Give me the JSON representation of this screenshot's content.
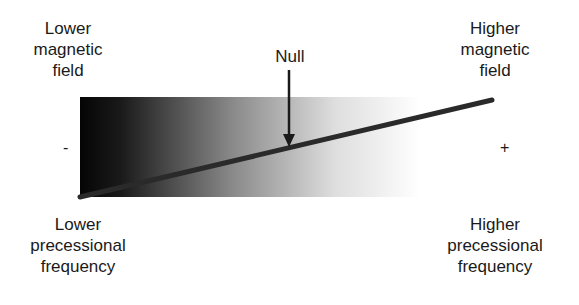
{
  "labels": {
    "top_left": [
      "Lower",
      "magnetic",
      "field"
    ],
    "top_right": [
      "Higher",
      "magnetic",
      "field"
    ],
    "bottom_left": [
      "Lower",
      "precessional",
      "frequency"
    ],
    "bottom_right": [
      "Higher",
      "precessional",
      "frequency"
    ],
    "null": "Null",
    "minus": "-",
    "plus": "+"
  },
  "colors": {
    "gradient_start": "#050505",
    "gradient_end": "#ffffff",
    "line": "#2a2a2a",
    "text": "#1a1a1a"
  }
}
